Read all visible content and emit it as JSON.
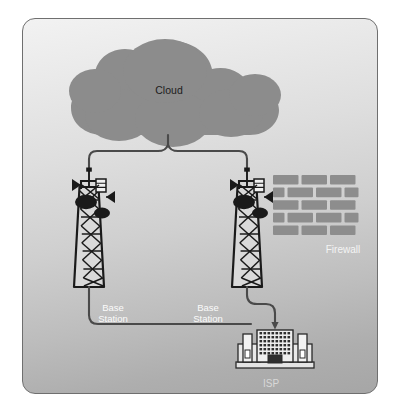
{
  "panel": {
    "border_color": "#6f6f6f",
    "corner_radius": 13,
    "background_top": "#f2f2f2",
    "background_bottom": "#a6a6a6"
  },
  "diagram": {
    "type": "network-topology",
    "title": "",
    "colors": {
      "cloud_fill": "#8c8c8c",
      "tower_stroke": "#1a1a1a",
      "tower_fill": "#d9d9d9",
      "link_line": "#4a4a4a",
      "brick_fill": "#8d8d8d",
      "building_stroke": "#2a2a2a",
      "building_fill": "#e8e8e8",
      "label_light": "#fbfbfb",
      "label_dark": "#1c1c1c"
    },
    "nodes": [
      {
        "id": "cloud",
        "kind": "cloud",
        "label": "Cloud",
        "label_color": "#1c1c1c",
        "x": 146,
        "y": 70
      },
      {
        "id": "base-station-left",
        "kind": "tower",
        "label": "Base\nStation",
        "label_color": "#fbfbfb",
        "x": 90,
        "y": 215
      },
      {
        "id": "base-station-right",
        "kind": "tower",
        "label": "Base\nStation",
        "label_color": "#fbfbfb",
        "x": 185,
        "y": 215
      },
      {
        "id": "firewall",
        "kind": "brick-wall",
        "label": "Firewall",
        "label_color": "#f4f4f4",
        "x": 320,
        "y": 196,
        "brick_rows": 5,
        "brick_columns": 3
      },
      {
        "id": "isp",
        "kind": "building",
        "label": "ISP",
        "label_color": "#d8d8d8",
        "x": 248,
        "y": 330
      }
    ],
    "links": [
      {
        "id": "cloud-to-towers",
        "from": "cloud",
        "to": [
          "base-station-left",
          "base-station-right"
        ],
        "style": "bracket"
      },
      {
        "id": "left-tower-to-isp",
        "from": "base-station-left",
        "to": "isp",
        "style": "orthogonal"
      },
      {
        "id": "right-tower-to-isp",
        "from": "base-station-right",
        "to": "isp",
        "style": "orthogonal-arrow"
      }
    ]
  },
  "labels": {
    "cloud": "Cloud",
    "base_station_left": "Base\nStation",
    "base_station_right": "Base\nStation",
    "firewall": "Firewall",
    "isp": "ISP"
  }
}
